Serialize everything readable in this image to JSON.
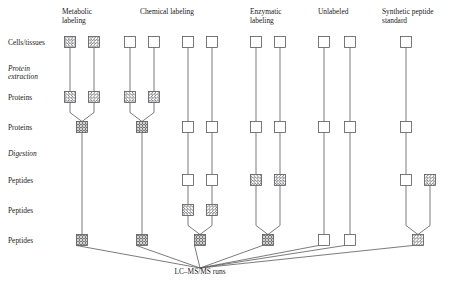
{
  "figure": {
    "title_label": "LC–MS/MS runs",
    "row_labels": [
      {
        "text": "Cells/tissues",
        "style": "normal",
        "y": 42
      },
      {
        "text": "Protein",
        "style": "italic",
        "y": 68
      },
      {
        "text": "extraction",
        "style": "italic",
        "y": 76
      },
      {
        "text": "Proteins",
        "style": "normal",
        "y": 97
      },
      {
        "text": "Proteins",
        "style": "normal",
        "y": 127
      },
      {
        "text": "Digestion",
        "style": "italic",
        "y": 153
      },
      {
        "text": "Peptides",
        "style": "normal",
        "y": 180
      },
      {
        "text": "Peptides",
        "style": "normal",
        "y": 210
      },
      {
        "text": "Peptides",
        "style": "normal",
        "y": 240
      }
    ],
    "column_headers": [
      {
        "lines": [
          "Metabolic",
          "labeling"
        ],
        "x": 62
      },
      {
        "lines": [
          "Chemical labeling"
        ],
        "x": 140
      },
      {
        "lines": [
          "Enzymatic",
          "labeling"
        ],
        "x": 250
      },
      {
        "lines": [
          "Unlabeled"
        ],
        "x": 318
      },
      {
        "lines": [
          "Synthetic peptide",
          "standard"
        ],
        "x": 382
      }
    ],
    "colors": {
      "stroke": "#58585b",
      "background": "#ffffff",
      "text": "#1a1a1a"
    },
    "box_size": 11,
    "nodes": [
      {
        "id": "m1-cells",
        "x": 70,
        "y": 42,
        "fill": "forward"
      },
      {
        "id": "m2-cells",
        "x": 94,
        "y": 42,
        "fill": "backward"
      },
      {
        "id": "m1-prot",
        "x": 70,
        "y": 97,
        "fill": "forward"
      },
      {
        "id": "m2-prot",
        "x": 94,
        "y": 97,
        "fill": "backward"
      },
      {
        "id": "m-mix",
        "x": 82,
        "y": 127,
        "fill": "cross"
      },
      {
        "id": "m-pep",
        "x": 82,
        "y": 240,
        "fill": "cross"
      },
      {
        "id": "c1-cells",
        "x": 130,
        "y": 42,
        "fill": "plain"
      },
      {
        "id": "c2-cells",
        "x": 154,
        "y": 42,
        "fill": "plain"
      },
      {
        "id": "c1-prot",
        "x": 130,
        "y": 97,
        "fill": "forward"
      },
      {
        "id": "c2-prot",
        "x": 154,
        "y": 97,
        "fill": "backward"
      },
      {
        "id": "c-mix",
        "x": 142,
        "y": 127,
        "fill": "cross"
      },
      {
        "id": "c-pep",
        "x": 142,
        "y": 240,
        "fill": "cross"
      },
      {
        "id": "d1-cells",
        "x": 188,
        "y": 42,
        "fill": "plain"
      },
      {
        "id": "d2-cells",
        "x": 212,
        "y": 42,
        "fill": "plain"
      },
      {
        "id": "d1-prot",
        "x": 188,
        "y": 127,
        "fill": "plain"
      },
      {
        "id": "d2-prot",
        "x": 212,
        "y": 127,
        "fill": "plain"
      },
      {
        "id": "d1-pep",
        "x": 188,
        "y": 180,
        "fill": "plain"
      },
      {
        "id": "d2-pep",
        "x": 212,
        "y": 180,
        "fill": "plain"
      },
      {
        "id": "d1-lab",
        "x": 188,
        "y": 210,
        "fill": "forward"
      },
      {
        "id": "d2-lab",
        "x": 212,
        "y": 210,
        "fill": "backward"
      },
      {
        "id": "d-mix",
        "x": 200,
        "y": 240,
        "fill": "cross"
      },
      {
        "id": "e1-cells",
        "x": 256,
        "y": 42,
        "fill": "plain"
      },
      {
        "id": "e2-cells",
        "x": 280,
        "y": 42,
        "fill": "plain"
      },
      {
        "id": "e1-prot",
        "x": 256,
        "y": 127,
        "fill": "plain"
      },
      {
        "id": "e2-prot",
        "x": 280,
        "y": 127,
        "fill": "plain"
      },
      {
        "id": "e1-pep",
        "x": 256,
        "y": 180,
        "fill": "forward"
      },
      {
        "id": "e2-pep",
        "x": 280,
        "y": 180,
        "fill": "backward"
      },
      {
        "id": "e-mix",
        "x": 268,
        "y": 240,
        "fill": "cross"
      },
      {
        "id": "u1-cells",
        "x": 324,
        "y": 42,
        "fill": "plain"
      },
      {
        "id": "u2-cells",
        "x": 350,
        "y": 42,
        "fill": "plain"
      },
      {
        "id": "u1-prot",
        "x": 324,
        "y": 127,
        "fill": "plain"
      },
      {
        "id": "u2-prot",
        "x": 350,
        "y": 127,
        "fill": "plain"
      },
      {
        "id": "u1-pep",
        "x": 324,
        "y": 240,
        "fill": "plain"
      },
      {
        "id": "u2-pep",
        "x": 350,
        "y": 240,
        "fill": "plain"
      },
      {
        "id": "s-cells",
        "x": 406,
        "y": 42,
        "fill": "plain"
      },
      {
        "id": "s-prot",
        "x": 406,
        "y": 127,
        "fill": "plain"
      },
      {
        "id": "s-pep",
        "x": 406,
        "y": 180,
        "fill": "plain"
      },
      {
        "id": "s-std",
        "x": 430,
        "y": 180,
        "fill": "backward"
      },
      {
        "id": "s-mix",
        "x": 418,
        "y": 240,
        "fill": "backward"
      }
    ],
    "edges": [
      {
        "from": "m1-cells",
        "to": "m1-prot",
        "kind": "vertical"
      },
      {
        "from": "m2-cells",
        "to": "m2-prot",
        "kind": "vertical"
      },
      {
        "from": "m1-prot",
        "to": "m-mix",
        "kind": "merge"
      },
      {
        "from": "m2-prot",
        "to": "m-mix",
        "kind": "merge"
      },
      {
        "from": "m-mix",
        "to": "m-pep",
        "kind": "vertical"
      },
      {
        "from": "c1-cells",
        "to": "c1-prot",
        "kind": "vertical"
      },
      {
        "from": "c2-cells",
        "to": "c2-prot",
        "kind": "vertical"
      },
      {
        "from": "c1-prot",
        "to": "c-mix",
        "kind": "merge"
      },
      {
        "from": "c2-prot",
        "to": "c-mix",
        "kind": "merge"
      },
      {
        "from": "c-mix",
        "to": "c-pep",
        "kind": "vertical"
      },
      {
        "from": "d1-cells",
        "to": "d1-prot",
        "kind": "vertical"
      },
      {
        "from": "d2-cells",
        "to": "d2-prot",
        "kind": "vertical"
      },
      {
        "from": "d1-prot",
        "to": "d1-pep",
        "kind": "vertical"
      },
      {
        "from": "d2-prot",
        "to": "d2-pep",
        "kind": "vertical"
      },
      {
        "from": "d1-pep",
        "to": "d1-lab",
        "kind": "vertical"
      },
      {
        "from": "d2-pep",
        "to": "d2-lab",
        "kind": "vertical"
      },
      {
        "from": "d1-lab",
        "to": "d-mix",
        "kind": "merge"
      },
      {
        "from": "d2-lab",
        "to": "d-mix",
        "kind": "merge"
      },
      {
        "from": "e1-cells",
        "to": "e1-prot",
        "kind": "vertical"
      },
      {
        "from": "e2-cells",
        "to": "e2-prot",
        "kind": "vertical"
      },
      {
        "from": "e1-prot",
        "to": "e1-pep",
        "kind": "vertical"
      },
      {
        "from": "e2-prot",
        "to": "e2-pep",
        "kind": "vertical"
      },
      {
        "from": "e1-pep",
        "to": "e-mix",
        "kind": "merge"
      },
      {
        "from": "e2-pep",
        "to": "e-mix",
        "kind": "merge"
      },
      {
        "from": "u1-cells",
        "to": "u1-prot",
        "kind": "vertical"
      },
      {
        "from": "u2-cells",
        "to": "u2-prot",
        "kind": "vertical"
      },
      {
        "from": "u1-prot",
        "to": "u1-pep",
        "kind": "vertical"
      },
      {
        "from": "u2-prot",
        "to": "u2-pep",
        "kind": "vertical"
      },
      {
        "from": "s-cells",
        "to": "s-prot",
        "kind": "vertical"
      },
      {
        "from": "s-prot",
        "to": "s-pep",
        "kind": "vertical"
      },
      {
        "from": "s-pep",
        "to": "s-mix",
        "kind": "merge"
      },
      {
        "from": "s-std",
        "to": "s-mix",
        "kind": "merge"
      }
    ],
    "converge": {
      "target_x": 200,
      "target_y": 268,
      "sources": [
        "m-pep",
        "c-pep",
        "d-mix",
        "e-mix",
        "u1-pep",
        "u2-pep",
        "s-mix"
      ]
    }
  }
}
